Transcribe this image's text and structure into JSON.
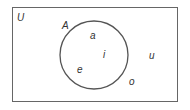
{
  "diagram": {
    "type": "venn",
    "universal_set": {
      "label": "U",
      "elements_outside": [
        "u",
        "o"
      ]
    },
    "sets": [
      {
        "label": "A",
        "elements": [
          "a",
          "i",
          "e"
        ]
      }
    ],
    "labels": {
      "U": "U",
      "A": "A",
      "a": "a",
      "i": "i",
      "e": "e",
      "u": "u",
      "o": "o"
    },
    "colors": {
      "stroke": "#555555",
      "text": "#333333",
      "background": "#ffffff"
    }
  }
}
